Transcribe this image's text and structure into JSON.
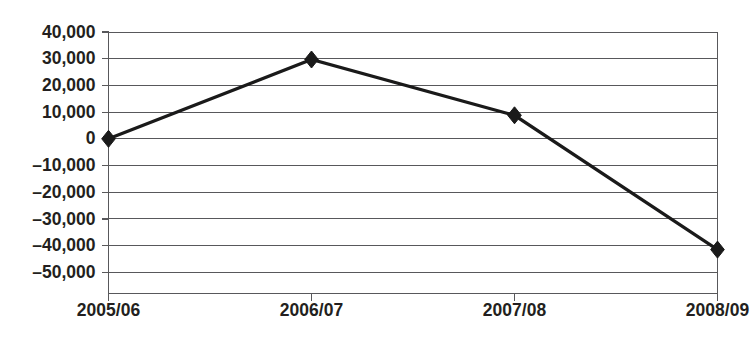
{
  "chart_data": {
    "type": "line",
    "title": "",
    "subtitle": "",
    "xlabel": "",
    "ylabel": "",
    "categories": [
      "2005/06",
      "2006/07",
      "2007/08",
      "2008/09"
    ],
    "values": [
      0,
      29700,
      8800,
      -41500
    ],
    "series": [
      {
        "name": "",
        "values": [
          0,
          29700,
          8800,
          -41500
        ]
      }
    ],
    "ylim": [
      -50000,
      40000
    ],
    "ytick_values": [
      40000,
      30000,
      20000,
      10000,
      0,
      -10000,
      -20000,
      -30000,
      -40000,
      -50000
    ],
    "ytick_labels": [
      "40,000",
      "30,000",
      "20,000",
      "10,000",
      "0",
      "–10,000",
      "–20,000",
      "–30,000",
      "–40,000",
      "–50,000"
    ],
    "xtick_labels": [
      "2005/06",
      "2006/07",
      "2007/08",
      "2008/09"
    ],
    "grid": true,
    "grid_axis": "y",
    "legend": false,
    "legend_position": "none",
    "marker": "diamond",
    "colors": {
      "line": "#1a1a1a",
      "marker": "#1a1a1a",
      "gridline": "#58585b",
      "axis": "#58585b",
      "label_text": "#231f20",
      "background": "#ffffff"
    }
  },
  "axes": {
    "y_axis_name": "y-axis",
    "x_axis_name": "x-axis"
  }
}
